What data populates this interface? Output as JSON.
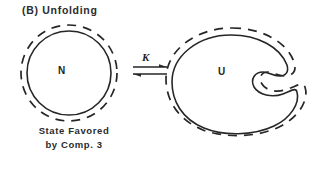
{
  "figure": {
    "panel_title": "(B) Unfolding",
    "caption_line_1": "State Favored",
    "caption_line_2": "by Comp. 3",
    "ink_color": "#262626",
    "background_color": "#ffffff"
  },
  "states": {
    "native": {
      "label": "N",
      "shape": "circle-with-dashed-halo"
    },
    "unfolded": {
      "label": "U",
      "shape": "blob-with-dashed-outline"
    }
  },
  "equilibrium": {
    "constant_label": "K",
    "arrow_type": "double-half-arrow-equilibrium"
  }
}
